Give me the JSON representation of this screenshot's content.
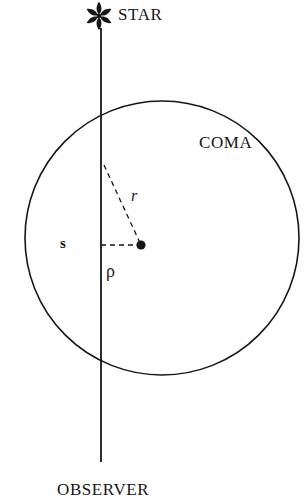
{
  "figure": {
    "domain": "scientific-diagram",
    "background_color": "#ffffff",
    "ink_color": "#161616"
  },
  "labels": {
    "star": "STAR",
    "coma": "COMA",
    "observer": "OBSERVER",
    "radius_r": "r",
    "impact_s": "s",
    "projected_rho": "ρ"
  },
  "icons": {
    "star_glyph": "star-asterisk-icon",
    "nucleus_glyph": "nucleus-dot-icon"
  },
  "geometry": {
    "canvas": {
      "width": 307,
      "height": 504
    },
    "coma_circle": {
      "cx": 162,
      "cy": 238,
      "r": 137,
      "stroke_width": 1.6,
      "fill": "none"
    },
    "sight_line": {
      "x": 101,
      "y_top": 28,
      "y_bottom": 462,
      "stroke_width": 1.8
    },
    "star_marker": {
      "cx": 99,
      "cy": 16,
      "points": 6,
      "petal_length": 14,
      "petal_width": 6
    },
    "nucleus_dot": {
      "cx": 141,
      "cy": 245,
      "r": 4.6
    },
    "dashed_r": {
      "x1": 104,
      "y1": 165,
      "x2": 141,
      "y2": 245,
      "dash": "5 4",
      "stroke_width": 1.3
    },
    "dashed_s": {
      "x1": 101,
      "y1": 245,
      "x2": 141,
      "y2": 245,
      "dash": "5 4",
      "stroke_width": 1.3
    }
  }
}
